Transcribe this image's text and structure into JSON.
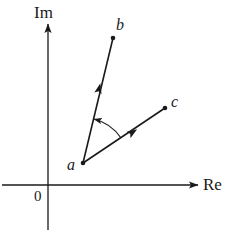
{
  "figure": {
    "background_color": "#ffffff",
    "stroke_color": "#1a1a1a",
    "width": 234,
    "height": 240
  },
  "axes": {
    "imaginary": {
      "label": "Im",
      "orientation": "vertical",
      "x": 48,
      "y_top": 22,
      "y_bottom": 230,
      "arrow_at": "top"
    },
    "real": {
      "label": "Re",
      "orientation": "horizontal",
      "y": 185,
      "x_left": 2,
      "x_right": 200,
      "arrow_at": "right"
    },
    "origin": {
      "label": "0",
      "x": 48,
      "y": 185
    }
  },
  "points": [
    {
      "name": "a",
      "label": "a",
      "x": 83,
      "y": 163,
      "label_position": "left"
    },
    {
      "name": "b",
      "label": "b",
      "x": 113,
      "y": 38,
      "label_position": "above-right"
    },
    {
      "name": "c",
      "label": "c",
      "x": 165,
      "y": 108,
      "label_position": "right"
    }
  ],
  "vectors": [
    {
      "name": "vector-a-to-b",
      "from": "a",
      "to": "b",
      "from_x": 83,
      "from_y": 163,
      "to_x": 113,
      "to_y": 38,
      "mid_arrow_x": 99,
      "mid_arrow_y": 89
    },
    {
      "name": "vector-a-to-c",
      "from": "a",
      "to": "c",
      "from_x": 83,
      "from_y": 163,
      "to_x": 165,
      "to_y": 108,
      "mid_arrow_x": 132,
      "mid_arrow_y": 133
    }
  ],
  "angle_arc": {
    "name": "angle-between-vectors",
    "vertex_x": 83,
    "vertex_y": 163,
    "radius": 46,
    "direction": "counterclockwise",
    "arrow_end": "vector-a-to-b"
  }
}
